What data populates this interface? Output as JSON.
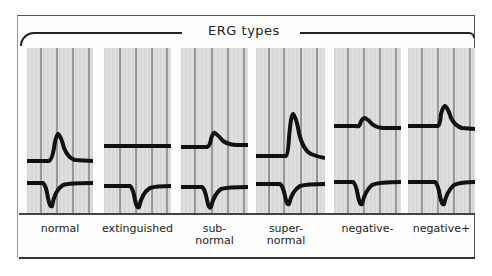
{
  "title": "ERG types",
  "panels": [
    {
      "id": "normal",
      "label": "normal"
    },
    {
      "id": "extinguished",
      "label": "extinguished"
    },
    {
      "id": "subnormal",
      "label_line1": "sub-",
      "label_line2": "normal"
    },
    {
      "id": "supernormal",
      "label_line1": "super-",
      "label_line2": "normal"
    },
    {
      "id": "negative-minus",
      "label": "negative-"
    },
    {
      "id": "negative-plus",
      "label": "negative+"
    }
  ]
}
